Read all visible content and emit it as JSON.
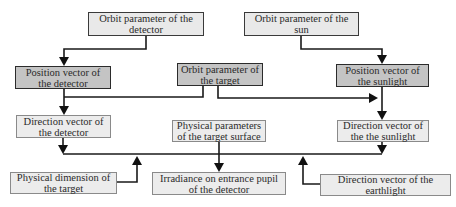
{
  "diagram": {
    "nodes": {
      "orbit_detector": {
        "label": "Orbit parameter of the detector"
      },
      "orbit_sun": {
        "label": "Orbit parameter of the sun"
      },
      "position_detector": {
        "label": "Position vector of the detector"
      },
      "orbit_target": {
        "label": "Orbit parameter of the target"
      },
      "position_sunlight": {
        "label": "Position vector of the sunlight"
      },
      "direction_detector": {
        "label": "Direction vector of the detector"
      },
      "physical_params_surface": {
        "label": "Physical parameters of the target surface"
      },
      "direction_sunlight": {
        "label": "Direction vector of the the sunlight"
      },
      "physical_dimension": {
        "label": "Physical dimension of the target"
      },
      "irradiance": {
        "label": "Irradiance on entrance pupil of the detector"
      },
      "direction_earthlight": {
        "label": "Direction vector of the earthlight"
      }
    },
    "edges": [
      {
        "from": "orbit_detector",
        "to": "position_detector"
      },
      {
        "from": "orbit_sun",
        "to": "position_sunlight"
      },
      {
        "from": "position_detector",
        "to": "direction_detector"
      },
      {
        "from": "position_detector",
        "to": "position_sunlight"
      },
      {
        "from": "orbit_target",
        "to": "direction_detector"
      },
      {
        "from": "orbit_target",
        "to": "position_sunlight"
      },
      {
        "from": "position_sunlight",
        "to": "direction_sunlight"
      },
      {
        "from": "direction_detector",
        "to": "irradiance"
      },
      {
        "from": "direction_sunlight",
        "to": "irradiance"
      },
      {
        "from": "physical_params_surface",
        "to": "irradiance"
      },
      {
        "from": "physical_dimension",
        "to": "irradiance"
      },
      {
        "from": "direction_earthlight",
        "to": "irradiance"
      }
    ],
    "colors": {
      "primary_box_fill": "#c4c4c4",
      "secondary_box_fill": "#e9e9e9",
      "line": "#1a1a1a"
    }
  }
}
